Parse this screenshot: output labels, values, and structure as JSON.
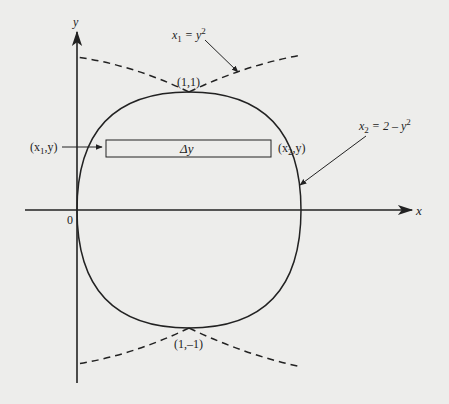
{
  "diagram": {
    "axes": {
      "x_label": "x",
      "y_label": "y",
      "origin_label": "0"
    },
    "curves": [
      {
        "name": "x1",
        "equation_lhs": "x",
        "equation_sub": "1",
        "equation_rhs": " = y",
        "equation_sup": "2",
        "style": "solid/dashed"
      },
      {
        "name": "x2",
        "equation_lhs": "x",
        "equation_sub": "2",
        "equation_rhs": " = 2 – y",
        "equation_sup": "2",
        "style": "solid/dashed"
      }
    ],
    "points": {
      "top": "(1,1)",
      "bottom": "(1,–1)"
    },
    "strip": {
      "label": "Δy",
      "left_label_open": "(x",
      "left_label_sub": "1",
      "left_label_close": ",y)",
      "right_label_open": "(x",
      "right_label_sub": "2",
      "right_label_close": ",y)"
    },
    "colors": {
      "ink": "#222222",
      "background": "#ededeb"
    }
  }
}
